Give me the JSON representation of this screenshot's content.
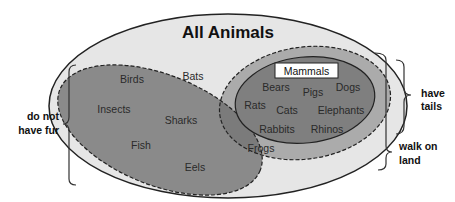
{
  "title": "All Animals",
  "colors": {
    "outer_fill": "#e6e6e6",
    "walk_on_land_fill": "#ababab",
    "no_fur_fill": "#8a8a8a",
    "mammals_fill": "#7f7f7f",
    "overlap_fill": "#7a7a7a",
    "stroke": "#222222"
  },
  "sets": {
    "all_animals": {
      "label": "All Animals",
      "members": [
        "Bats"
      ]
    },
    "do_not_have_fur": {
      "label": "do not have fur",
      "members": [
        "Birds",
        "Insects",
        "Sharks",
        "Fish",
        "Eels",
        "Frogs"
      ]
    },
    "walk_on_land": {
      "label": "walk on land",
      "members": [
        "Frogs"
      ]
    },
    "have_tails": {
      "label": "have tails"
    },
    "mammals": {
      "label": "Mammals",
      "members": [
        "Bears",
        "Pigs",
        "Dogs",
        "Rats",
        "Cats",
        "Elephants",
        "Rabbits",
        "Rhinos"
      ]
    }
  },
  "labels": {
    "bats": "Bats",
    "birds": "Birds",
    "insects": "Insects",
    "sharks": "Sharks",
    "fish": "Fish",
    "eels": "Eels",
    "frogs": "Frogs",
    "bears": "Bears",
    "pigs": "Pigs",
    "dogs": "Dogs",
    "rats": "Rats",
    "cats": "Cats",
    "elephants": "Elephants",
    "rabbits": "Rabbits",
    "rhinos": "Rhinos",
    "mammals": "Mammals"
  },
  "braces": {
    "left": {
      "line1": "do not",
      "line2": "have fur"
    },
    "right_tails": {
      "line1": "have",
      "line2": "tails"
    },
    "right_land": {
      "line1": "walk on",
      "line2": "land"
    }
  }
}
